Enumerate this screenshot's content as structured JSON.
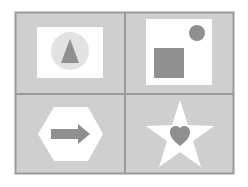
{
  "figure": {
    "colors": {
      "background": "#ffffff",
      "tile_fill": "#cfcfcf",
      "border": "#9a9a9a",
      "inner_white": "#ffffff",
      "shape_gray": "#8f8f8f",
      "circle_light": "#dcdcdc"
    },
    "cells": [
      {
        "position": "top-left",
        "icon": "triangle-in-circle-icon",
        "shapes": [
          "white-rectangle",
          "light-gray-circle",
          "gray-triangle"
        ]
      },
      {
        "position": "top-right",
        "icon": "square-and-circle-icon",
        "shapes": [
          "white-square-panel",
          "gray-square",
          "gray-circle"
        ]
      },
      {
        "position": "bottom-left",
        "icon": "arrow-in-hexagon-icon",
        "shapes": [
          "white-hexagon",
          "gray-right-arrow"
        ]
      },
      {
        "position": "bottom-right",
        "icon": "heart-in-star-icon",
        "shapes": [
          "white-star",
          "gray-heart"
        ]
      }
    ]
  }
}
